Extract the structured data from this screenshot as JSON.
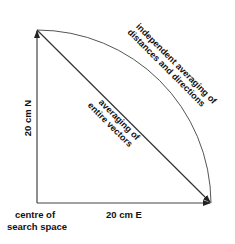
{
  "diagram": {
    "colors": {
      "line": "#333333",
      "arc": "#555555",
      "text": "#111111",
      "background": "#ffffff"
    },
    "labels": {
      "origin_line1": "centre of",
      "origin_line2": "search space",
      "east_axis": "20 cm E",
      "north_axis": "20 cm N",
      "diagonal_line1": "averaging of",
      "diagonal_line2": "entire vectors",
      "arc_line1": "independent averaging of",
      "arc_line2": "distances and directions"
    }
  }
}
